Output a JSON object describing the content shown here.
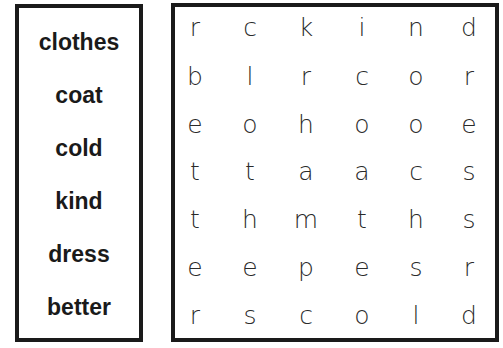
{
  "word_list": [
    "clothes",
    "coat",
    "cold",
    "kind",
    "dress",
    "better"
  ],
  "grid": [
    [
      "r",
      "c",
      "k",
      "i",
      "n",
      "d"
    ],
    [
      "b",
      "l",
      "r",
      "c",
      "o",
      "r"
    ],
    [
      "e",
      "o",
      "h",
      "o",
      "o",
      "e"
    ],
    [
      "t",
      "t",
      "a",
      "a",
      "c",
      "s"
    ],
    [
      "t",
      "h",
      "m",
      "t",
      "h",
      "s"
    ],
    [
      "e",
      "e",
      "p",
      "e",
      "s",
      "r"
    ],
    [
      "r",
      "s",
      "c",
      "o",
      "l",
      "d"
    ]
  ]
}
